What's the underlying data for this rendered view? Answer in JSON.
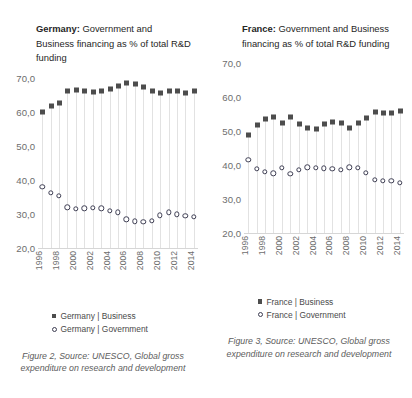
{
  "panels": [
    {
      "title_country": "Germany:",
      "title_rest": " Government and Business financing as % of total R&D funding",
      "legend": [
        {
          "marker": "filled-square-marker",
          "label": "Germany | Business"
        },
        {
          "marker": "open-circle-marker",
          "label": "Germany | Government"
        }
      ],
      "caption": "Figure 2, Source: UNESCO, Global gross expenditure on research and development"
    },
    {
      "title_country": "France:",
      "title_rest": " Government and Business financing as % of total R&D funding",
      "legend": [
        {
          "marker": "filled-square-marker",
          "label": "France | Business"
        },
        {
          "marker": "open-circle-marker",
          "label": "France | Government"
        }
      ],
      "caption": "Figure 3, Source: UNESCO, Global gross expenditure on research and development"
    }
  ],
  "chart_data": [
    {
      "type": "scatter",
      "title": "Germany: Government and Business financing as % of total R&D funding",
      "xlabel": "",
      "ylabel": "",
      "ylim": [
        20.0,
        70.0
      ],
      "yticks": [
        20.0,
        30.0,
        40.0,
        50.0,
        60.0,
        70.0
      ],
      "ytick_labels": [
        "20,0",
        "30,0",
        "40,0",
        "50,0",
        "60,0",
        "70,0"
      ],
      "x": [
        1996,
        1997,
        1998,
        1999,
        2000,
        2001,
        2002,
        2003,
        2004,
        2005,
        2006,
        2007,
        2008,
        2009,
        2010,
        2011,
        2012,
        2013,
        2014
      ],
      "xtick_labels": [
        "1996",
        "",
        "1998",
        "",
        "2000",
        "",
        "2002",
        "",
        "2004",
        "",
        "2006",
        "",
        "2008",
        "",
        "2010",
        "",
        "2012",
        "",
        "2014"
      ],
      "grid": false,
      "legend_position": "bottom",
      "series": [
        {
          "name": "Germany | Business",
          "marker": "filled-square",
          "color": "#4d4d4d",
          "values": [
            60.0,
            61.6,
            62.5,
            66.0,
            66.4,
            66.1,
            65.7,
            66.2,
            66.8,
            67.6,
            68.5,
            68.3,
            67.3,
            66.1,
            65.6,
            66.1,
            66.0,
            65.4,
            66.0
          ]
        },
        {
          "name": "Germany | Government",
          "marker": "open-circle",
          "color": "#3d3d52",
          "values": [
            37.9,
            36.2,
            35.3,
            31.9,
            31.4,
            31.6,
            31.7,
            31.6,
            30.9,
            30.4,
            28.4,
            27.8,
            27.7,
            28.0,
            29.6,
            30.4,
            29.8,
            29.4,
            29.2
          ]
        }
      ]
    },
    {
      "type": "scatter",
      "title": "France: Government and Business financing as % of total R&D funding",
      "xlabel": "",
      "ylabel": "",
      "ylim": [
        20.0,
        70.0
      ],
      "yticks": [
        20.0,
        30.0,
        40.0,
        50.0,
        60.0,
        70.0
      ],
      "ytick_labels": [
        "20,0",
        "30,0",
        "40,0",
        "50,0",
        "60,0",
        "70,0"
      ],
      "x": [
        1996,
        1997,
        1998,
        1999,
        2000,
        2001,
        2002,
        2003,
        2004,
        2005,
        2006,
        2007,
        2008,
        2009,
        2010,
        2011,
        2012,
        2013,
        2014
      ],
      "xtick_labels": [
        "1996",
        "",
        "1998",
        "",
        "2000",
        "",
        "2002",
        "",
        "2004",
        "",
        "2006",
        "",
        "2008",
        "",
        "2010",
        "",
        "2012",
        "",
        "2014"
      ],
      "grid": false,
      "legend_position": "bottom",
      "series": [
        {
          "name": "France | Business",
          "marker": "filled-square",
          "color": "#4d4d4d",
          "values": [
            48.9,
            51.8,
            53.5,
            54.1,
            52.5,
            54.2,
            52.1,
            50.8,
            50.7,
            52.1,
            52.8,
            52.4,
            50.8,
            52.3,
            53.8,
            55.5,
            55.4,
            55.3,
            55.9
          ]
        },
        {
          "name": "France | Government",
          "marker": "open-circle",
          "color": "#3d3d52",
          "values": [
            41.5,
            39.0,
            38.0,
            37.6,
            39.2,
            37.4,
            38.6,
            39.4,
            39.3,
            39.1,
            39.0,
            38.6,
            39.4,
            39.3,
            37.8,
            35.7,
            35.4,
            35.4,
            34.9
          ]
        }
      ]
    }
  ]
}
